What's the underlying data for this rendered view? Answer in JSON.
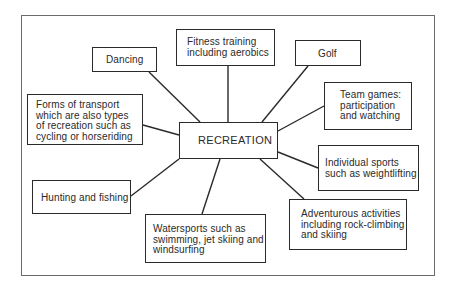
{
  "diagram": {
    "type": "mind-map",
    "center": {
      "id": "recreation",
      "label": "RECREATION"
    },
    "nodes": [
      {
        "id": "dancing",
        "label": "Dancing"
      },
      {
        "id": "fitness",
        "label": "Fitness training\nincluding aerobics"
      },
      {
        "id": "golf",
        "label": "Golf"
      },
      {
        "id": "team-games",
        "label": "Team games:\nparticipation\nand watching"
      },
      {
        "id": "individual-sports",
        "label": "Individual sports\nsuch as weightlifting"
      },
      {
        "id": "adventurous",
        "label": "Adventurous activities\nincluding rock-climbing\nand skiing"
      },
      {
        "id": "watersports",
        "label": "Watersports such as\nswimming, jet skiing and\nwindsurfing"
      },
      {
        "id": "hunting",
        "label": "Hunting and fishing"
      },
      {
        "id": "transport",
        "label": "Forms of transport\nwhich are also types\nof recreation such as\ncycling or horseriding"
      }
    ],
    "edges": [
      [
        "recreation",
        "dancing"
      ],
      [
        "recreation",
        "fitness"
      ],
      [
        "recreation",
        "golf"
      ],
      [
        "recreation",
        "team-games"
      ],
      [
        "recreation",
        "individual-sports"
      ],
      [
        "recreation",
        "adventurous"
      ],
      [
        "recreation",
        "watersports"
      ],
      [
        "recreation",
        "hunting"
      ],
      [
        "recreation",
        "transport"
      ]
    ],
    "colors": {
      "line": "#2a2a2a",
      "frame": "#6a6a6a",
      "background": "#ffffff"
    }
  }
}
